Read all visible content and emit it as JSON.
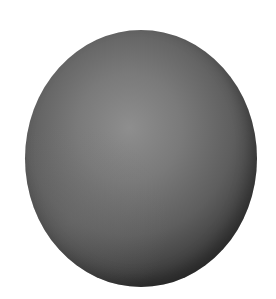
{
  "scene": {
    "description": "Shaded gray sphere on white background",
    "background_color": "#ffffff",
    "sphere": {
      "highlight_color": "#8e8e8e",
      "midtone_color": "#5e5e5e",
      "shadow_color": "#2a2a2a"
    }
  }
}
